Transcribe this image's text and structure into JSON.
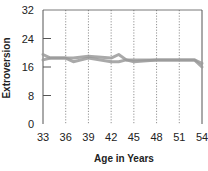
{
  "chart_data": {
    "type": "line",
    "title": "",
    "xlabel": "Age in Years",
    "ylabel": "Extroversion",
    "xlim": [
      33,
      54
    ],
    "ylim": [
      0,
      32
    ],
    "x_ticks": [
      33,
      36,
      39,
      42,
      45,
      48,
      51,
      54
    ],
    "y_ticks": [
      0,
      8,
      16,
      24,
      32
    ],
    "grid": {
      "x": "dotted vertical lines at each x tick",
      "y": false
    },
    "legend": null,
    "series": [
      {
        "name": "series-1",
        "x": [
          33,
          34,
          36,
          37,
          39,
          42,
          43,
          44,
          45,
          48,
          51,
          53,
          54
        ],
        "values": [
          19.5,
          18.5,
          18.5,
          18.5,
          19,
          18.5,
          19.5,
          18,
          18,
          18,
          18,
          18,
          17
        ]
      },
      {
        "name": "series-2",
        "x": [
          33,
          34,
          36,
          37,
          39,
          42,
          43,
          44,
          45,
          48,
          51,
          53,
          54
        ],
        "values": [
          18,
          18.5,
          18.5,
          17.5,
          18.5,
          17.5,
          17.5,
          18,
          17.5,
          18,
          18,
          18,
          16
        ]
      }
    ]
  },
  "colors": {
    "line": "#9a9a9a",
    "axis": "#555555",
    "grid": "#777777"
  }
}
